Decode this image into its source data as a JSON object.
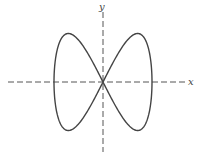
{
  "figure": {
    "x_axis_label": "x",
    "y_axis_label": "y",
    "curve_type": "lissajous figure-eight",
    "parametric": {
      "x": "sin(t)",
      "y": "sin(2t)"
    },
    "colors": {
      "curve": "#444444",
      "axes": "#555555",
      "background": "#ffffff"
    }
  }
}
